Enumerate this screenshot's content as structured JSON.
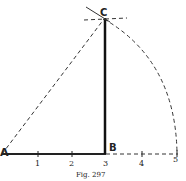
{
  "figure": {
    "caption": "Fig. 297",
    "points": {
      "A": {
        "label": "A"
      },
      "B": {
        "label": "B"
      },
      "C": {
        "label": "C"
      }
    },
    "ticks": [
      "1",
      "2",
      "3",
      "4",
      "5"
    ]
  }
}
